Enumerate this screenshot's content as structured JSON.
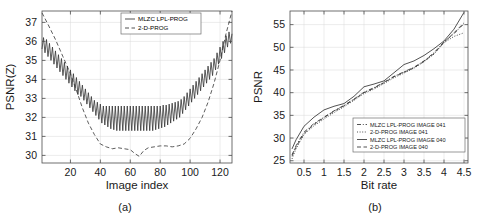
{
  "figure": {
    "panels": [
      {
        "caption": "(a)",
        "xlabel": "Image index",
        "ylabel": "PSNR(Z)"
      },
      {
        "caption": "(b)",
        "xlabel": "Bit rate",
        "ylabel": "PSNR"
      }
    ]
  },
  "chart_data": [
    {
      "type": "line",
      "title": "",
      "caption": "(a)",
      "xlabel": "Image index",
      "ylabel": "PSNR(Z)",
      "xlim": [
        1,
        128
      ],
      "ylim": [
        29.6,
        37.6
      ],
      "xticks": [
        20,
        40,
        60,
        80,
        100,
        120
      ],
      "yticks": [
        30,
        31,
        32,
        33,
        34,
        35,
        36,
        37
      ],
      "grid": true,
      "legend_position": "top-center",
      "series": [
        {
          "name": "MLZC LPL-PROG",
          "style": "solid",
          "color": "#333333",
          "comment": "rapidly oscillating curve, U-shaped envelope",
          "x": [
            1,
            2,
            3,
            4,
            5,
            6,
            7,
            8,
            9,
            10,
            11,
            12,
            13,
            14,
            15,
            16,
            17,
            18,
            19,
            20,
            21,
            22,
            23,
            24,
            25,
            26,
            27,
            28,
            29,
            30,
            31,
            32,
            33,
            34,
            35,
            36,
            37,
            38,
            39,
            40,
            41,
            42,
            43,
            44,
            45,
            46,
            47,
            48,
            49,
            50,
            51,
            52,
            53,
            54,
            55,
            56,
            57,
            58,
            59,
            60,
            61,
            62,
            63,
            64,
            65,
            66,
            67,
            68,
            69,
            70,
            71,
            72,
            73,
            74,
            75,
            76,
            77,
            78,
            79,
            80,
            81,
            82,
            83,
            84,
            85,
            86,
            87,
            88,
            89,
            90,
            91,
            92,
            93,
            94,
            95,
            96,
            97,
            98,
            99,
            100,
            101,
            102,
            103,
            104,
            105,
            106,
            107,
            108,
            109,
            110,
            111,
            112,
            113,
            114,
            115,
            116,
            117,
            118,
            119,
            120,
            121,
            122,
            123,
            124,
            125,
            126,
            127,
            128
          ],
          "y": [
            35.6,
            36.2,
            35.4,
            36.1,
            35.2,
            35.9,
            35.0,
            35.7,
            34.8,
            35.5,
            34.6,
            35.3,
            34.4,
            35.1,
            34.2,
            34.9,
            34.0,
            34.7,
            33.8,
            34.5,
            33.6,
            34.3,
            33.4,
            34.1,
            33.2,
            33.9,
            33.1,
            33.7,
            32.9,
            33.5,
            32.7,
            33.3,
            32.5,
            33.1,
            32.3,
            32.9,
            32.1,
            32.8,
            31.9,
            32.7,
            31.7,
            32.6,
            31.6,
            32.6,
            31.5,
            32.6,
            31.4,
            32.6,
            31.35,
            32.6,
            31.3,
            32.6,
            31.3,
            32.6,
            31.3,
            32.6,
            31.3,
            32.6,
            31.3,
            32.6,
            31.3,
            32.6,
            31.3,
            32.6,
            31.3,
            32.6,
            31.3,
            32.6,
            31.3,
            32.6,
            31.3,
            32.6,
            31.3,
            32.6,
            31.3,
            32.6,
            31.35,
            32.6,
            31.4,
            32.6,
            31.45,
            32.65,
            31.5,
            32.65,
            31.6,
            32.7,
            31.7,
            32.75,
            31.8,
            32.8,
            31.9,
            32.85,
            32.0,
            32.95,
            32.2,
            33.1,
            32.4,
            33.3,
            32.6,
            33.5,
            32.8,
            33.7,
            33.0,
            33.9,
            33.2,
            34.1,
            33.4,
            34.3,
            33.6,
            34.5,
            33.8,
            34.7,
            34.0,
            34.9,
            34.2,
            35.1,
            34.5,
            35.4,
            34.8,
            35.7,
            35.1,
            36.0,
            35.4,
            36.3,
            35.7,
            36.5,
            35.9,
            36.4
          ]
        },
        {
          "name": "2-D-PROG",
          "style": "dashed",
          "color": "#333333",
          "comment": "smooth U-shaped curve, minimum near index 66",
          "x": [
            1,
            5,
            10,
            15,
            20,
            25,
            28,
            32,
            36,
            40,
            44,
            48,
            52,
            56,
            60,
            63,
            66,
            69,
            72,
            76,
            80,
            84,
            88,
            92,
            96,
            100,
            104,
            108,
            112,
            116,
            120,
            124,
            128
          ],
          "y": [
            37.5,
            36.9,
            36.1,
            35.2,
            34.3,
            33.2,
            32.5,
            31.7,
            31.1,
            30.6,
            30.45,
            30.35,
            30.4,
            30.35,
            30.3,
            30.1,
            29.95,
            30.25,
            30.4,
            30.45,
            30.5,
            30.5,
            30.45,
            30.5,
            30.6,
            30.9,
            31.4,
            32.0,
            32.8,
            33.8,
            35.0,
            36.4,
            37.6
          ]
        }
      ]
    },
    {
      "type": "line",
      "title": "",
      "caption": "(b)",
      "xlabel": "Bit rate",
      "ylabel": "PSNR",
      "xlim": [
        0.15,
        4.6
      ],
      "ylim": [
        24.5,
        58.0
      ],
      "xticks": [
        0.5,
        1,
        1.5,
        2,
        2.5,
        3,
        3.5,
        4,
        4.5
      ],
      "xtick_labels": [
        "0.5",
        "1",
        "1.5",
        "2",
        "2.5",
        "3",
        "3.5",
        "4",
        "4.5"
      ],
      "yticks": [
        25,
        30,
        35,
        40,
        45,
        50,
        55
      ],
      "grid": true,
      "legend_position": "bottom-right",
      "series": [
        {
          "name": "MLZC LPL-PROG IMAGE 041",
          "style": "dashdot",
          "color": "#333333",
          "x": [
            0.2,
            0.3,
            0.5,
            0.75,
            1.0,
            1.25,
            1.5,
            1.75,
            2.0,
            2.25,
            2.5,
            2.75,
            3.0,
            3.25,
            3.5,
            3.75,
            4.0,
            4.25,
            4.5
          ],
          "y": [
            26.3,
            28.3,
            31.3,
            33.2,
            34.6,
            36.0,
            37.2,
            38.6,
            40.1,
            41.1,
            42.3,
            43.6,
            44.6,
            45.6,
            47.0,
            48.8,
            51.2,
            53.0,
            55.2
          ]
        },
        {
          "name": "2-D-PROG IMAGE 041",
          "style": "dotted",
          "color": "#333333",
          "x": [
            0.2,
            0.3,
            0.5,
            0.75,
            1.0,
            1.25,
            1.5,
            1.75,
            2.0,
            2.25,
            2.5,
            2.75,
            3.0,
            3.25,
            3.5,
            3.75,
            4.0,
            4.25,
            4.5
          ],
          "y": [
            25.4,
            27.6,
            30.8,
            32.7,
            34.2,
            35.6,
            36.9,
            38.3,
            39.8,
            40.8,
            42.0,
            43.3,
            44.3,
            45.4,
            46.8,
            48.5,
            51.0,
            52.4,
            53.2
          ]
        },
        {
          "name": "MLZC LPL-PROG IMAGE 040",
          "style": "solid",
          "color": "#333333",
          "x": [
            0.2,
            0.3,
            0.5,
            0.75,
            1.0,
            1.25,
            1.5,
            1.75,
            2.0,
            2.25,
            2.5,
            2.75,
            3.0,
            3.25,
            3.5,
            3.75,
            4.0,
            4.25,
            4.5
          ],
          "y": [
            27.6,
            29.6,
            32.6,
            34.6,
            36.2,
            37.0,
            37.6,
            39.2,
            41.3,
            41.9,
            42.6,
            44.4,
            46.2,
            47.0,
            48.2,
            49.7,
            51.4,
            54.0,
            57.7
          ]
        },
        {
          "name": "2-D-PROG IMAGE 040",
          "style": "dashed",
          "color": "#333333",
          "x": [
            0.2,
            0.3,
            0.5,
            0.75,
            1.0,
            1.25,
            1.5,
            1.75,
            2.0,
            2.25,
            2.5,
            2.75,
            3.0,
            3.25,
            3.5,
            3.75,
            4.0,
            4.25,
            4.5
          ],
          "y": [
            26.0,
            28.0,
            31.0,
            33.0,
            34.5,
            35.9,
            37.1,
            38.5,
            40.0,
            41.0,
            42.2,
            43.5,
            44.5,
            45.5,
            46.9,
            48.6,
            51.1,
            53.2,
            55.4
          ]
        }
      ]
    }
  ]
}
